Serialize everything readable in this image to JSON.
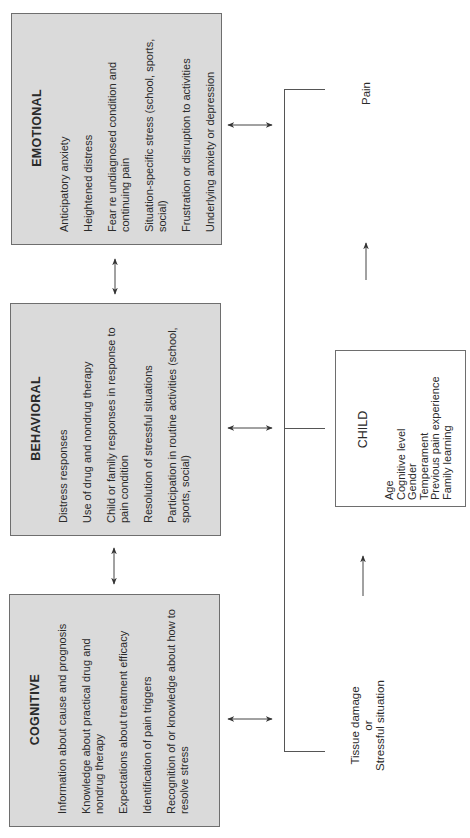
{
  "categories": {
    "emotional": {
      "title": "EMOTIONAL",
      "items": [
        "Anticipatory anxiety",
        "Heightened distress",
        "Fear re undiagnosed condition and continuing pain",
        "Situation-specific stress (school, sports, social)",
        "Frustration or disruption to activities",
        "Underlying anxiety or depression"
      ]
    },
    "behavioral": {
      "title": "BEHAVIORAL",
      "items": [
        "Distress responses",
        "Use of drug and nondrug therapy",
        "Child or family responses in response to pain condition",
        "Resolution of stressful situations",
        "Participation in routine activities (school, sports, social)"
      ]
    },
    "cognitive": {
      "title": "COGNITIVE",
      "items": [
        "Information about cause and prognosis",
        "Knowledge about practical drug and nondrug therapy",
        "Expectations about treatment efficacy",
        "Identification of pain triggers",
        "Recognition of  or knowledge about how to resolve stress"
      ]
    }
  },
  "child": {
    "title": "CHILD",
    "factors": [
      "Age",
      "Cognitive level",
      "Gender",
      "Temperament",
      "Previous pain experience",
      "Family learning"
    ]
  },
  "outcome": {
    "label": "Pain"
  },
  "trigger": {
    "line1": "Tissue damage",
    "line2": "or",
    "line3": "Stressful situation"
  },
  "colors": {
    "box_fill": "#dadada",
    "box_border": "#6e6e6e",
    "line": "#555555"
  },
  "footer": {
    "page_number": ""
  }
}
